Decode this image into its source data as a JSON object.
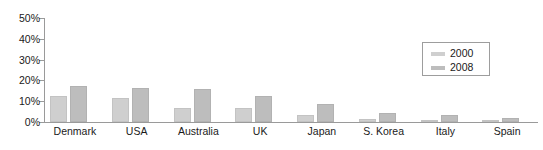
{
  "chart_data": {
    "type": "bar",
    "title": "",
    "subtitle": "",
    "xlabel": "",
    "ylabel": "",
    "ylim": [
      0,
      50
    ],
    "grid": false,
    "legend_position": "top-right",
    "y_ticks": [
      "0%",
      "10%",
      "20%",
      "30%",
      "40%",
      "50%"
    ],
    "y_tick_values": [
      0,
      10,
      20,
      30,
      40,
      50
    ],
    "categories": [
      "Denmark",
      "USA",
      "Australia",
      "UK",
      "Japan",
      "S. Korea",
      "Italy",
      "Spain"
    ],
    "series": [
      {
        "name": "2000",
        "color": "#cfcfcf",
        "values": [
          12.5,
          11.5,
          6.5,
          6.5,
          3.5,
          1.5,
          1,
          0.5
        ]
      },
      {
        "name": "2008",
        "color": "#bdbdbd",
        "values": [
          17.5,
          16.5,
          16,
          12.5,
          8.5,
          4.5,
          3.5,
          2
        ]
      }
    ]
  },
  "legend": {
    "entries": [
      {
        "label": "2000",
        "color": "#cfcfcf"
      },
      {
        "label": "2008",
        "color": "#bdbdbd"
      }
    ]
  },
  "axis": {
    "line_color": "#9a9a9a",
    "text_color": "#1a1a1a"
  }
}
